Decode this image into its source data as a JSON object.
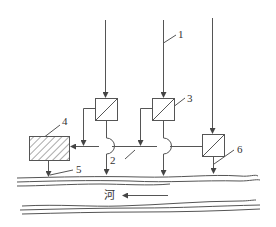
{
  "diagram": {
    "type": "process-flow schematic (wastewater discharge to river)",
    "colors": {
      "line": "#555555",
      "hatch": "#555555",
      "background": "#ffffff",
      "text": "#333333"
    },
    "labels": {
      "l1": "1",
      "l2": "2",
      "l3": "3",
      "l4": "4",
      "l5": "5",
      "l6": "6",
      "river": "河"
    },
    "components": [
      {
        "id": "1",
        "name": "inflow pipe",
        "shape": "vertical arrow line"
      },
      {
        "id": "2",
        "name": "collection pipe",
        "shape": "horizontal line with crossover bumps"
      },
      {
        "id": "3",
        "name": "treatment unit",
        "shape": "square with diagonal"
      },
      {
        "id": "4",
        "name": "central treatment facility",
        "shape": "hatched rectangle"
      },
      {
        "id": "5",
        "name": "outfall to river",
        "shape": "arrow"
      },
      {
        "id": "6",
        "name": "local treatment unit with direct discharge",
        "shape": "square with diagonal"
      }
    ],
    "river": {
      "label": "河",
      "flow_direction": "right-to-left"
    }
  }
}
